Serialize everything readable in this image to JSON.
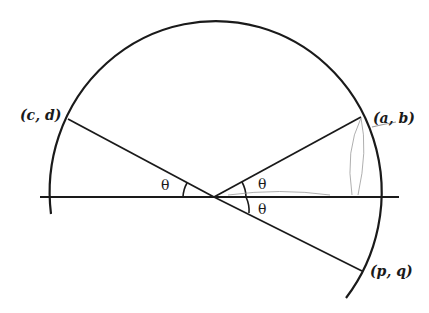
{
  "diagram": {
    "type": "unit-circle-reflection",
    "colors": {
      "stroke": "#1a1a1a",
      "pencil": "#9a9a9a",
      "background": "#ffffff"
    },
    "points": {
      "ab": {
        "label": "(a, b)"
      },
      "cd": {
        "label": "(c, d)"
      },
      "pq": {
        "label": "(p, q)"
      }
    },
    "angles": {
      "left": "θ",
      "upper_right": "θ",
      "lower_right": "θ"
    }
  }
}
